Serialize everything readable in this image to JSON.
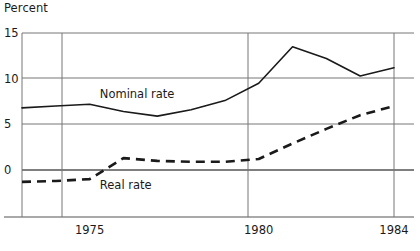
{
  "chart_data": {
    "type": "line",
    "title": "",
    "xlabel": "",
    "ylabel": "Percent",
    "ylim": [
      0,
      15
    ],
    "xlim": [
      1973,
      1984
    ],
    "yticks": [
      "0",
      "5",
      "10",
      "15"
    ],
    "ytick_values": [
      0,
      5,
      10,
      15
    ],
    "xticks": [
      "1975",
      "1980",
      "1984"
    ],
    "xtick_values": [
      1975,
      1980,
      1984
    ],
    "grid": "horizontal-and-vertical-at-ticks",
    "legend": "inline-labels",
    "x": [
      1973,
      1974,
      1975,
      1976,
      1977,
      1978,
      1979,
      1980,
      1981,
      1982,
      1983,
      1984
    ],
    "series": [
      {
        "name": "Nominal rate",
        "style": "solid",
        "color": "#1a1a1a",
        "label_x": 1975.3,
        "label_y": 8.3,
        "values": [
          6.8,
          7.0,
          7.2,
          6.4,
          5.9,
          6.6,
          7.6,
          9.5,
          13.5,
          12.2,
          10.3,
          11.2
        ]
      },
      {
        "name": "Real rate",
        "style": "dashed",
        "color": "#1a1a1a",
        "label_x": 1975.3,
        "label_y": -1.6,
        "values": [
          -1.3,
          -1.2,
          -1.0,
          1.3,
          1.0,
          0.9,
          0.9,
          1.2,
          2.9,
          4.5,
          6.0,
          7.0
        ]
      }
    ]
  },
  "geometry": {
    "plot_left": 22,
    "plot_right": 394,
    "plot_overhang_right": 414,
    "plot_top": 33,
    "plot_bottom": 217,
    "y_at_zero": 170,
    "y_at_5": 124,
    "y_at_10": 78,
    "y_at_15": 33
  },
  "colors": {
    "grid": "#767676",
    "axis": "#555555",
    "line": "#1a1a1a",
    "background": "#ffffff",
    "text": "#1a1a1a"
  }
}
